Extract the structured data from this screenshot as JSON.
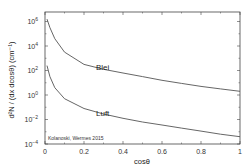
{
  "chart_data": {
    "type": "line",
    "title": "",
    "xlabel": "cosθ",
    "ylabel": "d²N / (dx dcosθ) (cm⁻¹)",
    "xlim": [
      0,
      1
    ],
    "ylim": [
      0.0001,
      2000000
    ],
    "yscale": "log",
    "grid": false,
    "x_ticks": [
      "0",
      "0.2",
      "0.4",
      "0.6",
      "0.8",
      "1"
    ],
    "y_ticks": [
      {
        "base": "10",
        "exp": "6"
      },
      {
        "base": "10",
        "exp": "4"
      },
      {
        "base": "10",
        "exp": "2"
      },
      {
        "base": "10",
        "exp": "0"
      },
      {
        "base": "10",
        "exp": "−2"
      },
      {
        "base": "10",
        "exp": "−4"
      }
    ],
    "series": [
      {
        "name": "Blei",
        "x": [
          0.01,
          0.025,
          0.05,
          0.1,
          0.2,
          0.3,
          0.4,
          0.5,
          0.6,
          0.7,
          0.8,
          0.9,
          1.0
        ],
        "log10_y": [
          6.2,
          5.5,
          4.6,
          3.5,
          2.5,
          2.1,
          1.8,
          1.5,
          1.2,
          0.95,
          0.7,
          0.5,
          0.3
        ]
      },
      {
        "name": "Luft",
        "x": [
          0.01,
          0.025,
          0.05,
          0.1,
          0.2,
          0.3,
          0.4,
          0.5,
          0.6,
          0.7,
          0.8,
          0.9,
          1.0
        ],
        "log10_y": [
          2.4,
          1.5,
          0.6,
          -0.3,
          -1.1,
          -1.55,
          -1.9,
          -2.2,
          -2.45,
          -2.7,
          -2.95,
          -3.2,
          -3.4
        ]
      }
    ],
    "annotations": [
      "Blei",
      "Luft",
      "Kolanoski, Wermes 2015"
    ]
  },
  "labels": {
    "xlabel": "cosθ",
    "ylabel": "d²N / (dx dcosθ) (cm⁻¹)",
    "blei": "Blei",
    "luft": "Luft",
    "credit": "Kolanoski, Wermes 2015"
  },
  "colors": {
    "line": "#555555",
    "frame": "#444444",
    "text": "#333333"
  }
}
